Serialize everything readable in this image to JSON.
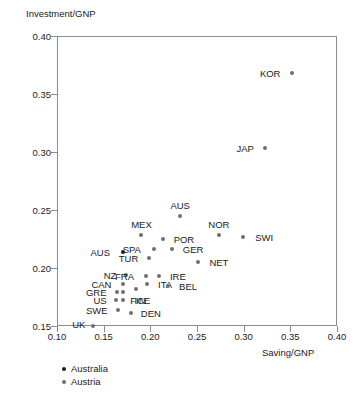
{
  "chart_data": {
    "type": "scatter",
    "title": "",
    "xlabel": "Saving/GNP",
    "ylabel": "Investment/GNP",
    "xlim": [
      0.1,
      0.4
    ],
    "ylim": [
      0.15,
      0.4
    ],
    "xticks": [
      "0.10",
      "0.15",
      "0.20",
      "0.25",
      "0.30",
      "0.35",
      "0.40"
    ],
    "xtick_values": [
      0.1,
      0.15,
      0.2,
      0.25,
      0.3,
      0.35,
      0.4
    ],
    "yticks": [
      "0.15",
      "0.20",
      "0.25",
      "0.30",
      "0.35",
      "0.40"
    ],
    "ytick_values": [
      0.15,
      0.2,
      0.25,
      0.3,
      0.35,
      0.4
    ],
    "grid": false,
    "legend_position": "below-axes-left",
    "series": [
      {
        "name": "Australia",
        "color": "#1a1a1a",
        "points": [
          {
            "label": "AUS",
            "x": 0.171,
            "y": 0.2135,
            "label_dx": -23,
            "label_dy": 0
          }
        ]
      },
      {
        "name": "Austria",
        "color": "#707070",
        "points": [
          {
            "label": "KOR",
            "x": 0.352,
            "y": 0.3685,
            "label_dx": -22,
            "label_dy": 0
          },
          {
            "label": "JAP",
            "x": 0.323,
            "y": 0.3035,
            "label_dx": -20,
            "label_dy": 0
          },
          {
            "label": "AUS",
            "x": 0.232,
            "y": 0.2448,
            "label_dx": 0,
            "label_dy": -11
          },
          {
            "label": "NOR",
            "x": 0.2735,
            "y": 0.2288,
            "label_dx": 0,
            "label_dy": -11
          },
          {
            "label": "SWI",
            "x": 0.2995,
            "y": 0.2267,
            "label_dx": 21,
            "label_dy": 0
          },
          {
            "label": "MEX",
            "x": 0.1905,
            "y": 0.2288,
            "label_dx": 0,
            "label_dy": -11
          },
          {
            "label": "POR",
            "x": 0.2135,
            "y": 0.2246,
            "label_dx": 21,
            "label_dy": 0
          },
          {
            "label": "GER",
            "x": 0.2233,
            "y": 0.216,
            "label_dx": 21,
            "label_dy": 0
          },
          {
            "label": "SPA",
            "x": 0.2037,
            "y": 0.216,
            "label_dx": -22,
            "label_dy": 0
          },
          {
            "label": "TUR",
            "x": 0.1991,
            "y": 0.2083,
            "label_dx": -21,
            "label_dy": 0
          },
          {
            "label": "NET",
            "x": 0.251,
            "y": 0.2048,
            "label_dx": 21,
            "label_dy": 0
          },
          {
            "label": "NZ",
            "x": 0.1739,
            "y": 0.1939,
            "label_dx": -16,
            "label_dy": 0
          },
          {
            "label": "FRA",
            "x": 0.1949,
            "y": 0.1931,
            "label_dx": -21,
            "label_dy": 0
          },
          {
            "label": "IRE",
            "x": 0.2092,
            "y": 0.1931,
            "label_dx": 19,
            "label_dy": 0
          },
          {
            "label": "ITA",
            "x": 0.1966,
            "y": 0.1862,
            "label_dx": 18,
            "label_dy": 0
          },
          {
            "label": "BEL",
            "x": 0.219,
            "y": 0.1845,
            "label_dx": 20,
            "label_dy": 0
          },
          {
            "label": "CAN",
            "x": 0.1712,
            "y": 0.1862,
            "label_dx": -22,
            "label_dy": 0
          },
          {
            "label": "FIN",
            "x": 0.1845,
            "y": 0.1819,
            "label_dx": 2,
            "label_dy": 11
          },
          {
            "label": "GRE",
            "x": 0.1645,
            "y": 0.1793,
            "label_dx": -21,
            "label_dy": 0
          },
          {
            "label": "GRE2",
            "x": 0.1712,
            "y": 0.1793,
            "label_dx": 0,
            "label_dy": 0
          },
          {
            "label": "US",
            "x": 0.1632,
            "y": 0.1724,
            "label_dx": -16,
            "label_dy": 0
          },
          {
            "label": "ICE",
            "x": 0.1712,
            "y": 0.1724,
            "label_dx": 19,
            "label_dy": 0
          },
          {
            "label": "SWE",
            "x": 0.1651,
            "y": 0.1638,
            "label_dx": -21,
            "label_dy": 0
          },
          {
            "label": "UK",
            "x": 0.1383,
            "y": 0.15,
            "label_dx": -14,
            "label_dy": -2
          },
          {
            "label": "DEN",
            "x": 0.1791,
            "y": 0.1612,
            "label_dx": 20,
            "label_dy": 0
          }
        ]
      }
    ]
  },
  "legend": {
    "items": [
      {
        "label": "Australia",
        "marker": "black-dot"
      },
      {
        "label": "Austria",
        "marker": "gray-dot"
      }
    ]
  }
}
